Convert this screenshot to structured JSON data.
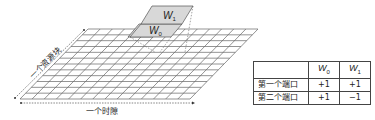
{
  "grid": {
    "label_vertical": "一个资源块",
    "label_horizontal": "一个时隙",
    "rows": 12,
    "cols": 14
  },
  "weights": {
    "w0": {
      "base": "W",
      "sub": "0"
    },
    "w1": {
      "base": "W",
      "sub": "1"
    }
  },
  "table": {
    "headers": [
      "",
      "W0",
      "W1"
    ],
    "header_w0": {
      "base": "W",
      "sub": "0"
    },
    "header_w1": {
      "base": "W",
      "sub": "1"
    },
    "rows": [
      {
        "label": "第一个端口",
        "w0": "+1",
        "w1": "+1"
      },
      {
        "label": "第二个端口",
        "w0": "+1",
        "w1": "−1"
      }
    ]
  },
  "colors": {
    "grid_line": "#555555",
    "weight_fill": "#dcdcdc",
    "text": "#222222"
  }
}
